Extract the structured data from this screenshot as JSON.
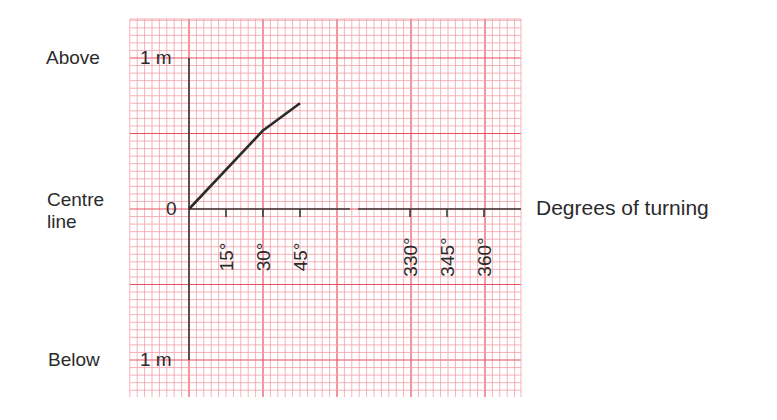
{
  "labels": {
    "above": "Above",
    "below": "Below",
    "centre_line_1": "Centre",
    "centre_line_2": "line",
    "top_value": "1 m",
    "bottom_value": "1 m",
    "zero": "0",
    "x_axis_title": "Degrees of turning"
  },
  "colors": {
    "grid_minor": "#f2a0a8",
    "grid_major": "#e8505e",
    "axis": "#3a3a3a",
    "line": "#2b2b2b"
  },
  "chart_data": {
    "type": "line",
    "title": "",
    "xlabel": "Degrees of turning",
    "ylabel": "",
    "x_ticks": [
      "15°",
      "30°",
      "45°",
      "330°",
      "345°",
      "360°"
    ],
    "x_tick_values": [
      15,
      30,
      45,
      330,
      345,
      360
    ],
    "y_ticks": [
      "Below 1 m",
      "Centre line 0",
      "Above 1 m"
    ],
    "y_tick_values": [
      -1,
      0,
      1
    ],
    "ylim": [
      -1,
      1
    ],
    "axis_break": "between 45° and 330°",
    "grid": true,
    "series": [
      {
        "name": "position",
        "x": [
          0,
          30,
          45
        ],
        "y": [
          0,
          0.52,
          0.7
        ]
      }
    ]
  }
}
